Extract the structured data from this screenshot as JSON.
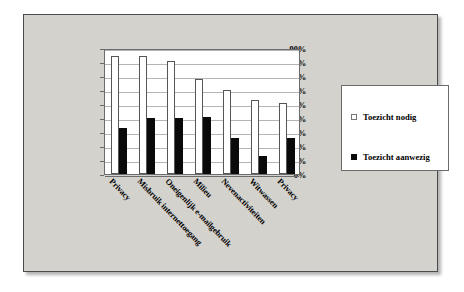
{
  "chart_data": {
    "type": "bar",
    "title": "",
    "subtitle": "",
    "xlabel": "",
    "ylabel": "",
    "ylim": [
      0,
      90
    ],
    "ytick_labels": [
      "90%",
      "80%",
      "70%",
      "60%",
      "50%",
      "40%",
      "30%",
      "20%",
      "10%",
      "0%"
    ],
    "ytick_values": [
      90,
      80,
      70,
      60,
      50,
      40,
      30,
      20,
      10,
      0
    ],
    "grid": true,
    "legend_position": "right",
    "categories": [
      "Privacy",
      "Misbruik internettoegang",
      "Oneigenlijk e-mailgebruik",
      "Milieu",
      "Nevenactiviteiten",
      "Witwassen",
      "Privacy"
    ],
    "series": [
      {
        "name": "Toezicht nodig",
        "color": "#ffffff",
        "values": [
          84,
          84,
          81,
          68,
          60,
          53,
          51
        ]
      },
      {
        "name": "Toezicht aanwezig",
        "color": "#000000",
        "values": [
          33,
          40,
          40,
          41,
          26,
          13,
          26
        ]
      }
    ]
  },
  "legend": {
    "items": [
      {
        "label": "Toezicht nodig",
        "swatch": "light"
      },
      {
        "label": "Toezicht aanwezig",
        "swatch": "dark"
      }
    ]
  },
  "colors": {
    "slide_background": "#ffffff",
    "frame_background": "#d4d2cd",
    "frame_border": "#4a4a4a",
    "plot_background": "#ffffff",
    "axis": "#6b6b6b",
    "gridline": "#b4b4b4",
    "bar_light": "#ffffff",
    "bar_dark": "#0a0a0a"
  }
}
